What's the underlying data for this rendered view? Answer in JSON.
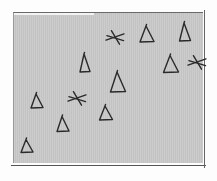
{
  "scene": {
    "description": "Hand-drawn sketch of scattered triangles and asterisks on a gray rectangle",
    "colors": {
      "panel": "#c9c9c9",
      "ink": "#2a2a2a",
      "background": "#fdfdfd"
    },
    "shapes": [
      {
        "type": "asterisk",
        "x": 115,
        "y": 37,
        "size": 9
      },
      {
        "type": "triangle",
        "x": 147,
        "y": 34,
        "w": 14,
        "h": 16
      },
      {
        "type": "triangle",
        "x": 185,
        "y": 32,
        "w": 11,
        "h": 18
      },
      {
        "type": "triangle",
        "x": 85,
        "y": 63,
        "w": 10,
        "h": 18
      },
      {
        "type": "triangle",
        "x": 171,
        "y": 64,
        "w": 15,
        "h": 17
      },
      {
        "type": "asterisk",
        "x": 197,
        "y": 62,
        "size": 9
      },
      {
        "type": "triangle",
        "x": 118,
        "y": 82,
        "w": 15,
        "h": 20
      },
      {
        "type": "triangle",
        "x": 37,
        "y": 101,
        "w": 12,
        "h": 14
      },
      {
        "type": "asterisk",
        "x": 77,
        "y": 98,
        "size": 9
      },
      {
        "type": "triangle",
        "x": 106,
        "y": 113,
        "w": 13,
        "h": 14
      },
      {
        "type": "triangle",
        "x": 63,
        "y": 124,
        "w": 12,
        "h": 15
      },
      {
        "type": "triangle",
        "x": 27,
        "y": 146,
        "w": 12,
        "h": 13
      }
    ]
  }
}
